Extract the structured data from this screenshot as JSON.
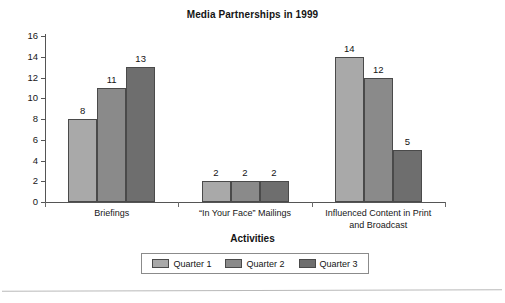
{
  "chart_data": {
    "type": "bar",
    "title": "Media Partnerships in 1999",
    "xlabel": "Activities",
    "ylabel": "",
    "ylim": [
      0,
      16
    ],
    "ytick_step": 2,
    "yticks": [
      "0",
      "2",
      "4",
      "6",
      "8",
      "10",
      "12",
      "14",
      "16"
    ],
    "grid": false,
    "legend_position": "bottom",
    "categories": [
      "Briefings",
      "“In Your Face” Mailings",
      "Influenced Content in Print and Broadcast"
    ],
    "category_lines": [
      [
        "Briefings"
      ],
      [
        "“In Your Face” Mailings"
      ],
      [
        "Influenced Content in Print",
        "and Broadcast"
      ]
    ],
    "series": [
      {
        "name": "Quarter 1",
        "color": "#a9a9a9",
        "values": [
          8,
          2,
          14
        ]
      },
      {
        "name": "Quarter 2",
        "color": "#8a8a8a",
        "values": [
          11,
          2,
          12
        ]
      },
      {
        "name": "Quarter 3",
        "color": "#6e6e6e",
        "values": [
          13,
          2,
          5
        ]
      }
    ],
    "value_labels": [
      [
        "8",
        "11",
        "13"
      ],
      [
        "2",
        "2",
        "2"
      ],
      [
        "14",
        "12",
        "5"
      ]
    ]
  }
}
